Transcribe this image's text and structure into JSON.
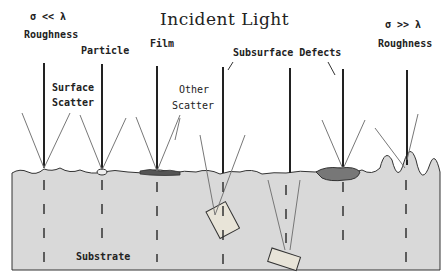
{
  "diagram": {
    "title": "Incident Light",
    "labels": {
      "left_condition": "σ << λ",
      "left_roughness": "Roughness",
      "right_condition": "σ >> λ",
      "right_roughness": "Roughness",
      "particle": "Particle",
      "film": "Film",
      "surface_scatter_1": "Surface",
      "surface_scatter_2": "Scatter",
      "other_scatter_1": "Other",
      "other_scatter_2": "Scatter",
      "subsurface_defects": "Subsurface Defects",
      "substrate": "Substrate"
    },
    "colors": {
      "substrate_fill": "#d9d9d9",
      "line": "#222222",
      "scatter_line": "#777777",
      "film": "#555555",
      "defect_fill": "#e8e4d8"
    },
    "incident_beams_x": [
      44,
      102,
      157,
      223,
      290,
      343,
      407
    ],
    "scenarios": [
      "Roughness σ<<λ",
      "Particle",
      "Film",
      "Subsurface Defect",
      "Subsurface Defect (deep)",
      "Subsurface Defect (inclusion)",
      "Roughness σ>>λ"
    ]
  }
}
